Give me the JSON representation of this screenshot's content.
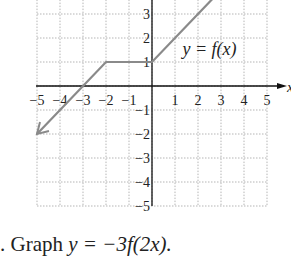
{
  "chart_data": {
    "type": "line",
    "title": "",
    "label": "y = f(x)",
    "xlabel": "x",
    "ylabel": "",
    "xlim": [
      -5,
      5
    ],
    "ylim": [
      -5,
      4
    ],
    "grid": true,
    "x_ticks": [
      -5,
      -4,
      -3,
      -2,
      -1,
      1,
      2,
      3,
      4,
      5
    ],
    "y_ticks": [
      -5,
      -4,
      -3,
      -2,
      -1,
      1,
      2,
      3
    ],
    "series": [
      {
        "name": "f(x)",
        "points": [
          [
            -5,
            -2
          ],
          [
            -2,
            1
          ],
          [
            0,
            1
          ],
          [
            3.5,
            4.5
          ]
        ],
        "arrow_left": true,
        "arrow_right": true,
        "color": "#8a8a8a"
      }
    ]
  },
  "problem": {
    "prefix": ". Graph ",
    "equation": "y = −3f(2x)."
  },
  "colors": {
    "grid": "#b5b5b5",
    "axis": "#111111",
    "curve": "#8a8a8a",
    "text": "#222222"
  }
}
